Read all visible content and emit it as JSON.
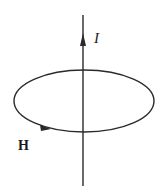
{
  "diagram": {
    "labels": {
      "current": "I",
      "field": "H"
    },
    "elements": [
      {
        "id": "wire",
        "type": "straight-conductor",
        "direction": "up",
        "label": "I"
      },
      {
        "id": "field-loop",
        "type": "closed-loop",
        "circulation": "counterclockwise (viewed from above)",
        "label": "H"
      }
    ],
    "colors": {
      "stroke": "#2a2a2a",
      "background": "#ffffff"
    }
  }
}
